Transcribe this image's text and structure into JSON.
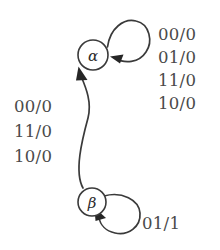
{
  "diagram": {
    "type": "finite-state-machine",
    "title": "",
    "states": [
      {
        "id": "alpha",
        "label": "α",
        "cx": 93,
        "cy": 55,
        "r": 15
      },
      {
        "id": "beta",
        "label": "β",
        "cx": 92,
        "cy": 202,
        "r": 14
      }
    ],
    "transitions": [
      {
        "id": "alpha-self-loop",
        "from": "alpha",
        "to": "alpha",
        "kind": "self-loop",
        "labels": [
          "00/0",
          "01/0",
          "11/0",
          "10/0"
        ]
      },
      {
        "id": "beta-to-alpha",
        "from": "beta",
        "to": "alpha",
        "kind": "curved-edge",
        "labels": [
          "00/0",
          "11/0",
          "10/0"
        ]
      },
      {
        "id": "beta-self-loop",
        "from": "beta",
        "to": "beta",
        "kind": "self-loop",
        "labels": [
          "01/1"
        ]
      }
    ],
    "label_groups": {
      "alpha_self": {
        "items": [
          {
            "text": "00/0",
            "top": 27
          },
          {
            "text": "01/0",
            "top": 50
          },
          {
            "text": "11/0",
            "top": 73
          },
          {
            "text": "10/0",
            "top": 96
          }
        ]
      },
      "beta_to_alpha": {
        "items": [
          {
            "text": "00/0",
            "top": 99
          },
          {
            "text": "11/0",
            "top": 124
          },
          {
            "text": "10/0",
            "top": 149
          }
        ]
      },
      "beta_self": {
        "items": [
          {
            "text": "01/1",
            "top": 216,
            "left": 142
          }
        ]
      }
    },
    "colors": {
      "background": "#ffffff",
      "stroke": "#3a3a3a",
      "text": "#4a4a4a",
      "arrow": "#262626"
    }
  }
}
